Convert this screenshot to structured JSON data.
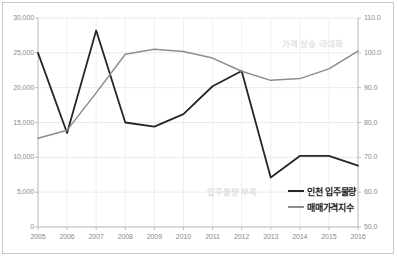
{
  "chart_data": {
    "type": "line",
    "title": "",
    "xlabel": "",
    "ylabel": "",
    "grid": true,
    "legend_position": "bottom-right",
    "categories": [
      "2005",
      "2006",
      "2007",
      "2008",
      "2009",
      "2010",
      "2011",
      "2012",
      "2013",
      "2014",
      "2015",
      "2016"
    ],
    "axes": {
      "x_tick_labels": [
        "2005",
        "2006",
        "2007",
        "2008",
        "2009",
        "2010",
        "2011",
        "2012",
        "2013",
        "2014",
        "2015",
        "2016"
      ],
      "y_left": {
        "label": "",
        "ylim": [
          0,
          30000
        ],
        "ticks": [
          0,
          5000,
          10000,
          15000,
          20000,
          25000,
          30000
        ],
        "tick_labels": [
          "0",
          "5,000",
          "10,000",
          "15,000",
          "20,000",
          "25,000",
          "30,000"
        ]
      },
      "y_right": {
        "label": "",
        "ylim": [
          50.0,
          110.0
        ],
        "ticks": [
          50.0,
          60.0,
          70.0,
          80.0,
          90.0,
          100.0,
          110.0
        ],
        "tick_labels": [
          "50.0",
          "60.0",
          "70.0",
          "80.0",
          "90.0",
          "100.0",
          "110.0"
        ]
      }
    },
    "series": [
      {
        "name": "인천 입주물량",
        "axis": "left",
        "color": "#262626",
        "values": [
          25000,
          13500,
          28200,
          15000,
          14400,
          16200,
          20200,
          22400,
          7100,
          10200,
          10200,
          8800
        ]
      },
      {
        "name": "매매가격지수",
        "axis": "right",
        "color": "#8d8d8d",
        "values": [
          75.5,
          77.8,
          88.5,
          99.6,
          101.0,
          100.4,
          98.5,
          94.7,
          92.1,
          92.6,
          95.4,
          100.5
        ]
      }
    ],
    "annotations": [
      {
        "text": "가격 상승 극대화",
        "color": "#e2e2e2"
      },
      {
        "text": "입주물량 부족",
        "color": "#e2e2e2"
      }
    ]
  },
  "legend": {
    "items": [
      {
        "label": "인천 입주물량",
        "color": "#262626"
      },
      {
        "label": "매매가격지수",
        "color": "#8d8d8d"
      }
    ]
  }
}
